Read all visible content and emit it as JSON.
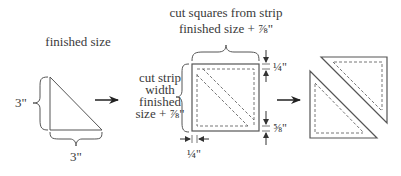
{
  "diagram": {
    "step1": {
      "title": "finished size",
      "height_label": "3\"",
      "width_label": "3\""
    },
    "step2": {
      "top_label_line1": "cut squares from strip",
      "top_label_line2": "finished size + ⅞\"",
      "left_label_line1": "cut strip",
      "left_label_line2": "width",
      "left_label_line3": "finished",
      "left_label_line4": "size + ⅞\"",
      "top_seam_label": "¼\"",
      "corner_seam_label": "⅝\"",
      "left_seam_label": "¼\""
    },
    "step3": {
      "description": "two half-square triangles"
    },
    "colors": {
      "line": "#555555",
      "dashed": "#666666",
      "text": "#3a3a3a",
      "arrow": "#222222"
    }
  }
}
